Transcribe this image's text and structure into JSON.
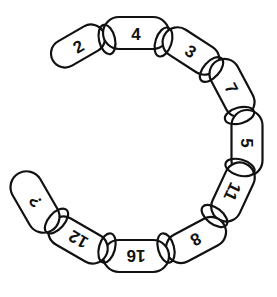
{
  "puzzle": {
    "type": "number-chain",
    "stroke_color": "#111111",
    "background": "#ffffff",
    "links": [
      {
        "label": "2",
        "cx": 78,
        "cy": 46,
        "w": 58,
        "h": 28,
        "angle": -30
      },
      {
        "label": "4",
        "cx": 136,
        "cy": 33,
        "w": 66,
        "h": 32,
        "angle": 0
      },
      {
        "label": "3",
        "cx": 191,
        "cy": 51,
        "w": 62,
        "h": 30,
        "angle": 33
      },
      {
        "label": "7",
        "cx": 232,
        "cy": 88,
        "w": 62,
        "h": 30,
        "angle": 62
      },
      {
        "label": "5",
        "cx": 247,
        "cy": 143,
        "w": 66,
        "h": 31,
        "angle": 90
      },
      {
        "label": "11",
        "cx": 233,
        "cy": 192,
        "w": 62,
        "h": 30,
        "angle": 115
      },
      {
        "label": "8",
        "cx": 196,
        "cy": 240,
        "w": 64,
        "h": 30,
        "angle": 152
      },
      {
        "label": "16",
        "cx": 136,
        "cy": 256,
        "w": 66,
        "h": 32,
        "angle": 180
      },
      {
        "label": "12",
        "cx": 78,
        "cy": 240,
        "w": 64,
        "h": 30,
        "angle": 210
      },
      {
        "label": "?",
        "cx": 35,
        "cy": 202,
        "w": 66,
        "h": 32,
        "angle": 240
      }
    ]
  }
}
